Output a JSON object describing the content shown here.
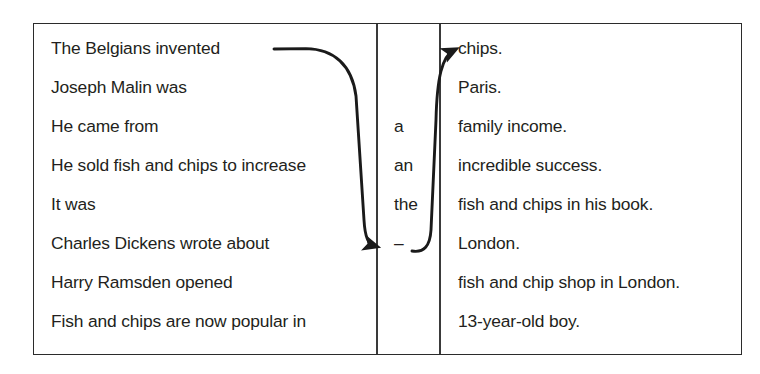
{
  "exercise": {
    "title": "Fish and chips sentence matching exercise",
    "columns": {
      "clauses_heading": "",
      "articles_heading": "",
      "endings_heading": ""
    },
    "clauses": [
      "The Belgians invented",
      "Joseph Malin was",
      "He came from",
      "He sold fish and chips to increase",
      "It was",
      "Charles Dickens wrote about",
      "Harry Ramsden opened",
      "Fish and chips are now popular in"
    ],
    "articles": [
      "",
      "",
      "a",
      "an",
      "the",
      "–",
      "",
      ""
    ],
    "endings": [
      "chips.",
      "Paris.",
      "family income.",
      "incredible success.",
      "fish and chips in his book.",
      "London.",
      "fish and chip shop in London.",
      "13-year-old boy."
    ],
    "arrows": [
      {
        "name": "arrow-clause1-to-article6",
        "from_row": 1,
        "from_column": "clauses",
        "to_row": 6,
        "to_column": "articles",
        "head": "arrowhead-right"
      },
      {
        "name": "arrow-article6-to-ending1",
        "from_row": 6,
        "from_column": "articles",
        "to_row": 1,
        "to_column": "endings",
        "head": "arrowhead-right"
      }
    ],
    "colors": {
      "text": "#231f20",
      "border": "#2b2b2b",
      "divider": "#3a3a3a",
      "arrow": "#1a1a1a",
      "background": "#ffffff"
    }
  }
}
